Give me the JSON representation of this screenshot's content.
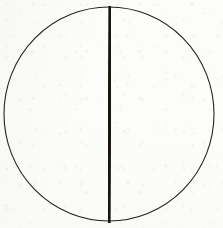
{
  "figure": {
    "title": "Circle bisected by a vertical diameter",
    "caption": "",
    "background_color": "#fcfcfb",
    "canvas": {
      "width": 223,
      "height": 228
    },
    "medium": "scanned line drawing on paper"
  },
  "shapes": {
    "circle": {
      "label": "Circle outline",
      "center_x": 109,
      "center_y": 114,
      "radius_x": 105,
      "radius_y": 107,
      "stroke_color": "#24211f",
      "stroke_width": 1.1,
      "fill": "none"
    },
    "diameter_line": {
      "label": "Vertical diameter",
      "x1": 110,
      "y1": 6,
      "x2": 109,
      "y2": 223,
      "stroke_color": "#141210",
      "stroke_width": 3.2,
      "orientation": "vertical"
    }
  },
  "annotations": {
    "labels": [],
    "axis_ticks": [],
    "legend": []
  }
}
